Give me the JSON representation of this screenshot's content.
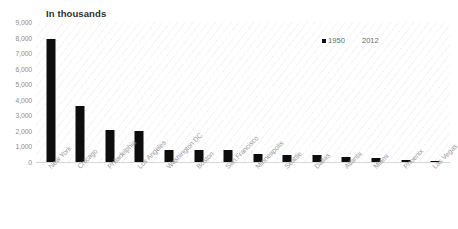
{
  "chart_data": {
    "type": "bar",
    "title": "In thousands",
    "xlabel": "",
    "ylabel": "",
    "ylim": [
      0,
      9000
    ],
    "yticks": [
      "9,000",
      "8,000",
      "7,000",
      "6,000",
      "5,000",
      "4,000",
      "3,000",
      "2,000",
      "1,000",
      "0"
    ],
    "ytick_values": [
      9000,
      8000,
      7000,
      6000,
      5000,
      4000,
      3000,
      2000,
      1000,
      0
    ],
    "grid": false,
    "legend_position": "top-right",
    "categories": [
      "New York",
      "Chicago",
      "Philadelphia",
      "Los Angeles",
      "Washington DC",
      "Boston",
      "San Francisco",
      "Minneapolis",
      "Seattle",
      "Dallas",
      "Atlanta",
      "Miami",
      "Phoenix",
      "Las Vegas"
    ],
    "series": [
      {
        "name": "1950",
        "color": "#0d0d0d",
        "values": [
          7892,
          3621,
          2072,
          1970,
          802,
          801,
          775,
          522,
          468,
          434,
          331,
          249,
          107,
          25
        ]
      },
      {
        "name": "2012",
        "color": "#ffffff",
        "values": [
          0,
          0,
          0,
          0,
          0,
          0,
          0,
          0,
          0,
          0,
          0,
          0,
          0,
          0
        ]
      }
    ]
  },
  "legend": {
    "items": [
      {
        "label": "1950",
        "swatch": "dark"
      },
      {
        "label": "2012",
        "swatch": "light"
      }
    ]
  }
}
